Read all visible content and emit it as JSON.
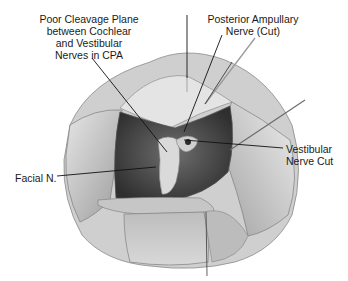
{
  "figure": {
    "type": "surgical-illustration",
    "labels": {
      "cleavage": {
        "lines": [
          "Poor Cleavage Plane",
          "between Cochlear",
          "and Vestibular",
          "Nerves in CPA"
        ]
      },
      "posterior_ampullary": {
        "lines": [
          "Posterior Ampullary",
          "Nerve (Cut)"
        ]
      },
      "vestibular_cut": {
        "lines": [
          "Vestibular",
          "Nerve Cut"
        ]
      },
      "facial": {
        "lines": [
          "Facial N."
        ]
      }
    },
    "colors": {
      "background": "#ffffff",
      "tissue_light": "#d9d9d9",
      "tissue_mid": "#a8a8a8",
      "tissue_dark": "#5a5a5a",
      "cavity_dark": "#3c3c3c",
      "leader_line": "#111111",
      "label_text": "#1a1a1a"
    }
  }
}
